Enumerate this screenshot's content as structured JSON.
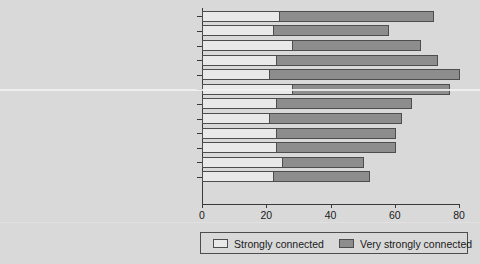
{
  "chart_data": {
    "type": "bar",
    "orientation": "horizontal",
    "stacked": true,
    "title": "",
    "xlabel": "",
    "ylabel": "",
    "xlim": [
      0,
      80
    ],
    "xticks": [
      0,
      20,
      40,
      60,
      80
    ],
    "grid": false,
    "legend_position": "bottom",
    "categories": [
      "Northland",
      "Auckland",
      "Waikato",
      "Bay of Plenty",
      "Gisborne",
      "Hawke's Bay",
      "Taranaki",
      "Manawatū-Whanganui",
      "Wellington",
      "Tasman, Nelson, Marlborough, West Coast",
      "Canterbury",
      "Otago, Southland"
    ],
    "series": [
      {
        "name": "Strongly connected",
        "color": "#e9e9e9",
        "values": [
          24,
          22,
          28,
          23,
          21,
          28,
          23,
          21,
          23,
          23,
          25,
          22
        ]
      },
      {
        "name": "Very strongly connected",
        "color": "#8d8d8d",
        "values": [
          48,
          36,
          40,
          50,
          59,
          49,
          42,
          41,
          37,
          37,
          25,
          30
        ]
      }
    ],
    "totals": [
      72,
      58,
      68,
      73,
      80,
      77,
      65,
      62,
      60,
      60,
      50,
      52
    ]
  },
  "legend": {
    "entries": [
      {
        "label": "Strongly connected",
        "swatch": "low"
      },
      {
        "label": "Very strongly connected",
        "swatch": "high"
      }
    ]
  },
  "axis": {
    "x_tick_labels": [
      "0",
      "20",
      "40",
      "60",
      "80"
    ]
  }
}
